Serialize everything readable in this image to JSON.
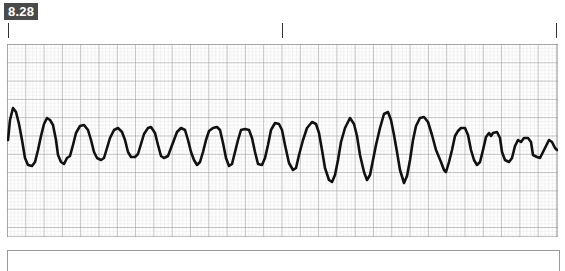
{
  "figure": {
    "label": "8.28"
  },
  "time_markers": {
    "positions_px": [
      8,
      282,
      556
    ]
  },
  "ecg_strip": {
    "grid": {
      "small_box_px": 3.66,
      "major_box_px": 18.3,
      "minor_color": "#d2d2d2",
      "major_color": "#8a8a8a",
      "border_color": "#8a8a8a"
    },
    "trace_color": "#111111",
    "rhythm_description": "polymorphic wide-complex tachycardia with waxing and waning amplitude"
  },
  "chart_data": {
    "type": "line",
    "title": "",
    "xlabel": "",
    "ylabel": "",
    "grid": true,
    "points": [
      [
        8,
        140
      ],
      [
        10,
        120
      ],
      [
        13,
        108
      ],
      [
        16,
        112
      ],
      [
        19,
        124
      ],
      [
        22,
        140
      ],
      [
        25,
        158
      ],
      [
        28,
        165
      ],
      [
        32,
        166
      ],
      [
        35,
        162
      ],
      [
        38,
        150
      ],
      [
        41,
        136
      ],
      [
        44,
        124
      ],
      [
        47,
        118
      ],
      [
        50,
        120
      ],
      [
        53,
        125
      ],
      [
        56,
        140
      ],
      [
        58,
        155
      ],
      [
        61,
        162
      ],
      [
        64,
        164
      ],
      [
        67,
        158
      ],
      [
        70,
        156
      ],
      [
        73,
        145
      ],
      [
        76,
        133
      ],
      [
        80,
        126
      ],
      [
        84,
        125
      ],
      [
        88,
        130
      ],
      [
        91,
        140
      ],
      [
        94,
        152
      ],
      [
        97,
        158
      ],
      [
        101,
        160
      ],
      [
        104,
        158
      ],
      [
        107,
        148
      ],
      [
        110,
        138
      ],
      [
        114,
        130
      ],
      [
        118,
        128
      ],
      [
        122,
        132
      ],
      [
        125,
        140
      ],
      [
        128,
        152
      ],
      [
        131,
        157
      ],
      [
        135,
        157
      ],
      [
        138,
        154
      ],
      [
        141,
        144
      ],
      [
        144,
        134
      ],
      [
        148,
        128
      ],
      [
        151,
        127
      ],
      [
        155,
        133
      ],
      [
        158,
        145
      ],
      [
        161,
        156
      ],
      [
        164,
        158
      ],
      [
        168,
        156
      ],
      [
        171,
        148
      ],
      [
        174,
        140
      ],
      [
        177,
        132
      ],
      [
        181,
        128
      ],
      [
        185,
        130
      ],
      [
        188,
        140
      ],
      [
        191,
        152
      ],
      [
        194,
        160
      ],
      [
        197,
        165
      ],
      [
        200,
        162
      ],
      [
        203,
        152
      ],
      [
        206,
        140
      ],
      [
        209,
        131
      ],
      [
        213,
        128
      ],
      [
        217,
        127
      ],
      [
        220,
        130
      ],
      [
        223,
        143
      ],
      [
        226,
        158
      ],
      [
        229,
        166
      ],
      [
        232,
        164
      ],
      [
        235,
        152
      ],
      [
        238,
        140
      ],
      [
        241,
        130
      ],
      [
        245,
        129
      ],
      [
        249,
        130
      ],
      [
        252,
        138
      ],
      [
        255,
        152
      ],
      [
        258,
        164
      ],
      [
        262,
        165
      ],
      [
        265,
        158
      ],
      [
        268,
        145
      ],
      [
        271,
        130
      ],
      [
        275,
        123
      ],
      [
        279,
        124
      ],
      [
        282,
        130
      ],
      [
        285,
        145
      ],
      [
        289,
        163
      ],
      [
        293,
        170
      ],
      [
        296,
        168
      ],
      [
        299,
        155
      ],
      [
        303,
        140
      ],
      [
        307,
        128
      ],
      [
        312,
        122
      ],
      [
        316,
        124
      ],
      [
        319,
        133
      ],
      [
        322,
        150
      ],
      [
        325,
        168
      ],
      [
        329,
        180
      ],
      [
        332,
        182
      ],
      [
        335,
        175
      ],
      [
        338,
        160
      ],
      [
        341,
        142
      ],
      [
        345,
        128
      ],
      [
        350,
        118
      ],
      [
        354,
        124
      ],
      [
        357,
        136
      ],
      [
        360,
        155
      ],
      [
        364,
        172
      ],
      [
        367,
        180
      ],
      [
        370,
        175
      ],
      [
        373,
        160
      ],
      [
        376,
        145
      ],
      [
        380,
        128
      ],
      [
        384,
        114
      ],
      [
        388,
        112
      ],
      [
        391,
        120
      ],
      [
        394,
        135
      ],
      [
        397,
        152
      ],
      [
        400,
        170
      ],
      [
        404,
        183
      ],
      [
        407,
        176
      ],
      [
        410,
        160
      ],
      [
        413,
        140
      ],
      [
        416,
        126
      ],
      [
        420,
        118
      ],
      [
        424,
        117
      ],
      [
        428,
        122
      ],
      [
        432,
        135
      ],
      [
        436,
        150
      ],
      [
        441,
        162
      ],
      [
        444,
        170
      ],
      [
        446,
        172
      ],
      [
        449,
        162
      ],
      [
        452,
        150
      ],
      [
        455,
        136
      ],
      [
        458,
        131
      ],
      [
        461,
        128
      ],
      [
        465,
        128
      ],
      [
        468,
        135
      ],
      [
        471,
        150
      ],
      [
        474,
        160
      ],
      [
        477,
        165
      ],
      [
        480,
        162
      ],
      [
        483,
        150
      ],
      [
        486,
        137
      ],
      [
        489,
        133
      ],
      [
        491,
        136
      ],
      [
        493,
        133
      ],
      [
        497,
        132
      ],
      [
        500,
        138
      ],
      [
        502,
        152
      ],
      [
        505,
        160
      ],
      [
        509,
        162
      ],
      [
        512,
        158
      ],
      [
        515,
        146
      ],
      [
        518,
        140
      ],
      [
        521,
        142
      ],
      [
        524,
        138
      ],
      [
        528,
        138
      ],
      [
        531,
        142
      ],
      [
        533,
        155
      ],
      [
        537,
        157
      ],
      [
        540,
        158
      ],
      [
        543,
        152
      ],
      [
        546,
        146
      ],
      [
        549,
        140
      ],
      [
        552,
        142
      ],
      [
        555,
        148
      ],
      [
        557,
        150
      ]
    ]
  },
  "caption": {
    "text": ""
  }
}
